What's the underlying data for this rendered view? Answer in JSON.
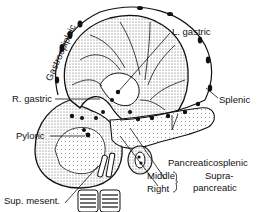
{
  "figure": {
    "labels": {
      "gastroepiploic": "Gastroepiploic",
      "l_gastric": "L. gastric",
      "splenic": "Splenic",
      "r_gastric": "R. gastric",
      "pyloric": "Pyloric",
      "pancreaticosplenic": "Pancreaticosplenic",
      "middle": "Middle",
      "right": "Right",
      "supra": "Supra-",
      "pancreatic": "pancreatic",
      "sup_mesent": "Sup. mesent."
    },
    "colors": {
      "ink": "#111111",
      "stipple": "#9a9a9a",
      "background": "#ffffff"
    }
  }
}
